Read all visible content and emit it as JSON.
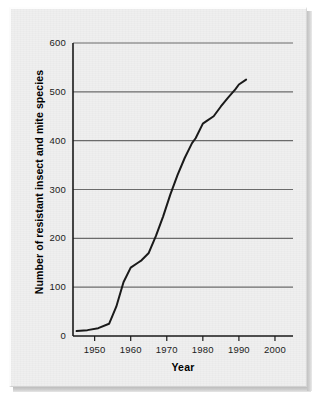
{
  "chart_data": {
    "type": "line",
    "title": "",
    "subtitle": "",
    "xlabel": "Year",
    "ylabel": "Number of resistant insect and mite species",
    "xlim": [
      1944,
      2005
    ],
    "ylim": [
      0,
      600
    ],
    "xticks": [
      1950,
      1960,
      1970,
      1980,
      1990,
      2000
    ],
    "xtick_labels": [
      "1950",
      "1960",
      "1970",
      "1980",
      "1990",
      "2000"
    ],
    "yticks": [
      0,
      100,
      200,
      300,
      400,
      500,
      600
    ],
    "ytick_labels": [
      "0",
      "100",
      "200",
      "300",
      "400",
      "500",
      "600"
    ],
    "grid": "horizontal",
    "legend": null,
    "legend_position": "none",
    "line_color": "#1a1a1a",
    "line_width": 2,
    "series": [
      {
        "name": "Resistant insect and mite species",
        "x": [
          1945,
          1948,
          1951,
          1954,
          1956,
          1958,
          1960,
          1962,
          1963,
          1965,
          1967,
          1969,
          1971,
          1973,
          1975,
          1977,
          1978,
          1980,
          1981,
          1983,
          1985,
          1987,
          1989,
          1990,
          1992
        ],
        "values": [
          10,
          12,
          16,
          25,
          60,
          110,
          140,
          150,
          155,
          170,
          205,
          245,
          290,
          330,
          365,
          395,
          405,
          435,
          440,
          450,
          470,
          488,
          505,
          515,
          525
        ]
      }
    ]
  },
  "axes": {
    "y_title": "Number of resistant insect and mite species",
    "x_title": "Year"
  },
  "colors": {
    "panel_background": "#efefef",
    "grid": "#6b6b6b",
    "axis": "#1a1a1a",
    "line": "#1a1a1a",
    "text": "#111111"
  }
}
